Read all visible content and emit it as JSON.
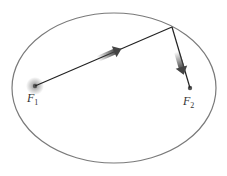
{
  "diagram": {
    "type": "ellipse-foci",
    "labels": {
      "focus1": "F",
      "focus1_sub": "1",
      "focus2": "F",
      "focus2_sub": "2"
    },
    "colors": {
      "ellipse": "#777777",
      "path": "#222222",
      "arrow": "#444444",
      "focus_dot": "#555555"
    }
  }
}
